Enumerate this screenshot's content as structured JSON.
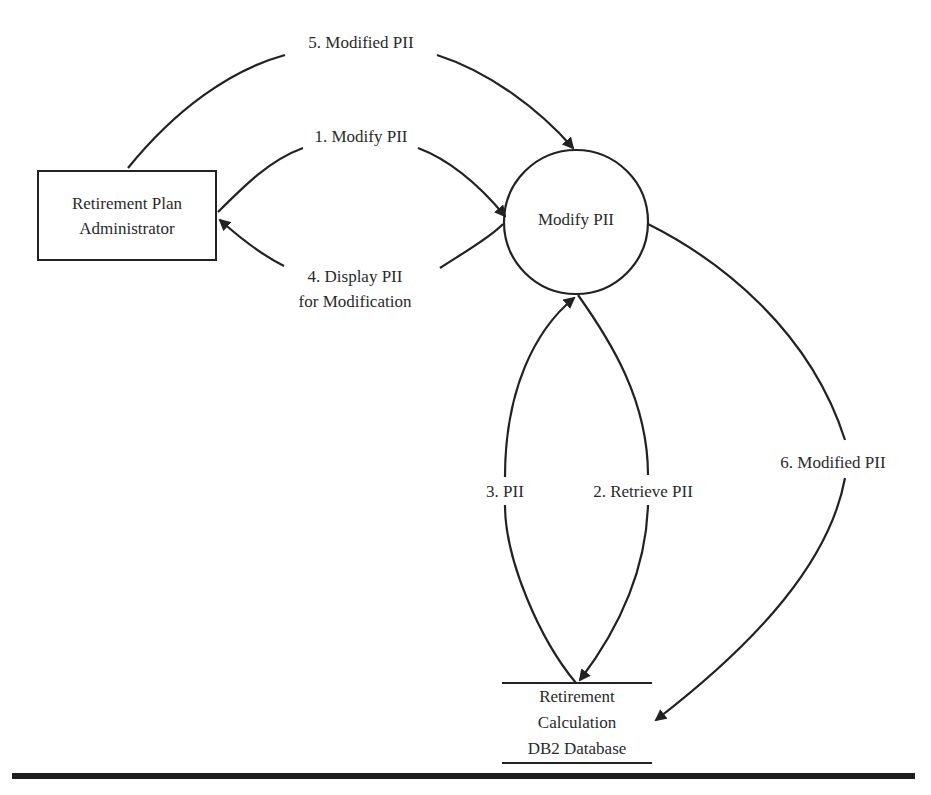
{
  "diagram": {
    "type": "data-flow-diagram",
    "entities": [
      {
        "id": "admin",
        "kind": "external-entity",
        "lines": [
          "Retirement Plan",
          "Administrator"
        ]
      }
    ],
    "processes": [
      {
        "id": "modify",
        "kind": "process",
        "label": "Modify PII"
      }
    ],
    "datastores": [
      {
        "id": "db",
        "kind": "data-store",
        "lines": [
          "Retirement",
          "Calculation",
          "DB2 Database"
        ]
      }
    ],
    "flows": [
      {
        "step": 1,
        "label": "1. Modify PII",
        "from": "admin",
        "to": "modify"
      },
      {
        "step": 2,
        "label": "2. Retrieve PII",
        "from": "modify",
        "to": "db"
      },
      {
        "step": 3,
        "label": "3. PII",
        "from": "db",
        "to": "modify"
      },
      {
        "step": 4,
        "lines": [
          "4. Display PII",
          "for Modification"
        ],
        "from": "modify",
        "to": "admin"
      },
      {
        "step": 5,
        "label": "5. Modified PII",
        "from": "admin",
        "to": "modify"
      },
      {
        "step": 6,
        "label": "6. Modified PII",
        "from": "modify",
        "to": "db"
      }
    ],
    "colors": {
      "stroke": "#222222",
      "background": "#ffffff",
      "text": "#2a2a2a"
    }
  }
}
